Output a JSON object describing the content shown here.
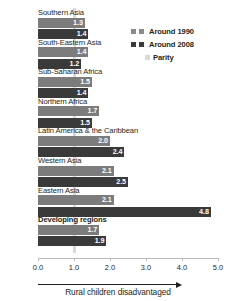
{
  "chart_data": {
    "type": "bar",
    "orientation": "horizontal",
    "title": "",
    "subtitle": "",
    "xlabel": "Rural children disadvantaged",
    "ylabel": "",
    "xlim": [
      0.0,
      5.0
    ],
    "xticks": [
      "0.0",
      "1.0",
      "2.0",
      "3.0",
      "4.0",
      "5.0"
    ],
    "xtick_values": [
      0.0,
      1.0,
      2.0,
      3.0,
      4.0,
      5.0
    ],
    "grid": false,
    "legend_position": "top-right",
    "reference_line": {
      "label": "Parity",
      "value": 1.0,
      "color": "#d9d9d9"
    },
    "categories": [
      "Southern Asia",
      "South-Eastern Asia",
      "Sub-Saharan Africa",
      "Northern Africa",
      "Latin America & the Caribbean",
      "Western Asia",
      "Eastern Asia",
      "Developing regions"
    ],
    "series": [
      {
        "name": "Around 1990",
        "color": "#7c7c7c",
        "values": [
          1.3,
          1.4,
          1.5,
          1.7,
          2.0,
          2.1,
          2.1,
          1.7
        ],
        "labels": [
          "1.3",
          "1.4",
          "1.5",
          "1.7",
          "2.0",
          "2.1",
          "2.1",
          "1.7"
        ]
      },
      {
        "name": "Around 2008",
        "color": "#3a3a3a",
        "values": [
          1.4,
          1.2,
          1.4,
          1.5,
          2.4,
          2.5,
          4.8,
          1.9
        ],
        "labels": [
          "1.4",
          "1.2",
          "1.4",
          "1.5",
          "2.4",
          "2.5",
          "4.8",
          "1.9"
        ]
      }
    ],
    "emphasized_category": "Developing regions"
  },
  "legend": {
    "items": [
      {
        "label": "Around 1990",
        "color": "#8a8a8a",
        "swatches": 2
      },
      {
        "label": "Around 2008",
        "color": "#3a3a3a",
        "swatches": 2
      },
      {
        "label": "Parity",
        "color": "#d9d9d9",
        "swatches": 1
      }
    ]
  }
}
